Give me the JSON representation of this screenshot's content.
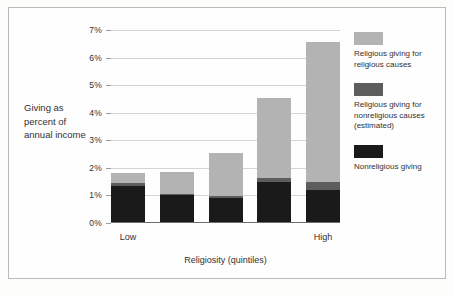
{
  "chart_data": {
    "type": "bar",
    "stacked": true,
    "title": "",
    "xlabel": "Religiosity (quintiles)",
    "ylabel": "Giving as percent of annual income",
    "categories": [
      "1",
      "2",
      "3",
      "4",
      "5"
    ],
    "x_tick_labels": [
      "Low",
      "High"
    ],
    "y_tick_labels": [
      "0%",
      "1%",
      "2%",
      "3%",
      "4%",
      "5%",
      "6%",
      "7%"
    ],
    "y_tick_values": [
      0,
      1,
      2,
      3,
      4,
      5,
      6,
      7
    ],
    "ylim": [
      0,
      7
    ],
    "grid": true,
    "legend_position": "right",
    "series": [
      {
        "name": "Nonreligious giving",
        "color": "#1a1a1a",
        "values": [
          1.35,
          1.0,
          0.9,
          1.5,
          1.2
        ]
      },
      {
        "name": "Religious giving for nonreligious causes (estimated)",
        "color": "#5d5d5d",
        "values": [
          0.1,
          0.07,
          0.07,
          0.12,
          0.3
        ]
      },
      {
        "name": "Religious giving for religious causes",
        "color": "#b3b3b3",
        "values": [
          0.35,
          0.78,
          1.58,
          2.93,
          5.05
        ]
      }
    ],
    "totals": [
      1.8,
      1.85,
      2.55,
      4.55,
      6.55
    ]
  },
  "axis": {
    "y_title": "Giving as percent of annual income",
    "x_title": "Religiosity (quintiles)",
    "y_ticks": [
      "7%",
      "6%",
      "5%",
      "4%",
      "3%",
      "2%",
      "1%",
      "0%"
    ],
    "x_low": "Low",
    "x_high": "High"
  },
  "legend": {
    "items": [
      {
        "label": "Religious giving for religious causes",
        "color": "#b3b3b3",
        "swatch_name": "legend-swatch-religious-religious"
      },
      {
        "label": "Religious giving for nonreligious causes (estimated)",
        "color": "#5d5d5d",
        "swatch_name": "legend-swatch-religious-nonreligious"
      },
      {
        "label": "Nonreligious giving",
        "color": "#1a1a1a",
        "swatch_name": "legend-swatch-nonreligious"
      }
    ]
  },
  "colors": {
    "frame_border": "#b9bbbd",
    "gridline": "#d2d4d6",
    "axis": "#6d6e70",
    "text": "#333031",
    "background": "#fefefe"
  }
}
